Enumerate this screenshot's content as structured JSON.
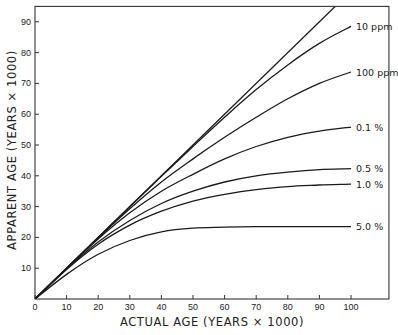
{
  "chart_data": {
    "type": "line",
    "title": "",
    "xlabel": "ACTUAL AGE (YEARS × 1000)",
    "ylabel": "APPARENT AGE (YEARS × 1000)",
    "xlim": [
      0,
      112
    ],
    "ylim": [
      0,
      95
    ],
    "grid": false,
    "legend_position": "inline labels at right end of curves",
    "xticks": [
      0,
      10,
      20,
      30,
      40,
      50,
      60,
      70,
      80,
      90,
      100
    ],
    "xtick_labels": [
      "0",
      "10",
      "20",
      "30",
      "40",
      "50",
      "60",
      "70",
      "80",
      "90",
      "100"
    ],
    "yticks": [
      10,
      20,
      30,
      40,
      50,
      60,
      70,
      80,
      90
    ],
    "ytick_labels": [
      "10",
      "20",
      "30",
      "40",
      "50",
      "60",
      "70",
      "80",
      "90"
    ],
    "origin_label": "0",
    "x": [
      0,
      10,
      20,
      30,
      40,
      50,
      60,
      70,
      80,
      90,
      100
    ],
    "series": [
      {
        "name": "1:1 reference line",
        "label": "",
        "values": [
          0,
          10,
          20,
          30,
          40,
          50,
          60,
          70,
          80,
          90,
          100
        ]
      },
      {
        "name": "10 ppm",
        "label": "10 ppm",
        "values": [
          0,
          10,
          20,
          30,
          39.8,
          49.5,
          59,
          68,
          76,
          83,
          88.5
        ]
      },
      {
        "name": "100 ppm",
        "label": "100 ppm",
        "values": [
          0,
          10,
          19.8,
          29.3,
          38,
          45.5,
          52.5,
          59,
          65,
          70,
          73.7
        ]
      },
      {
        "name": "0.1 %",
        "label": "0.1 %",
        "values": [
          0,
          10,
          19.5,
          28,
          35,
          40.5,
          45.5,
          49.5,
          52.5,
          54.5,
          55.8
        ]
      },
      {
        "name": "0.5 %",
        "label": "0.5 %",
        "values": [
          0,
          9.8,
          18.5,
          25.5,
          31,
          35,
          38,
          40,
          41.2,
          42,
          42.3
        ]
      },
      {
        "name": "1.0 %",
        "label": "1.0 %",
        "values": [
          0,
          9.6,
          17.8,
          24,
          28.5,
          31.8,
          34,
          35.5,
          36.5,
          37,
          37.3
        ]
      },
      {
        "name": "5.0 %",
        "label": "5.0 %",
        "values": [
          0,
          8,
          14.5,
          19,
          21.8,
          23,
          23.3,
          23.5,
          23.5,
          23.5,
          23.5
        ]
      }
    ],
    "colors": {
      "line": "#1a1a1a",
      "frame": "#333333",
      "text": "#222222"
    }
  }
}
